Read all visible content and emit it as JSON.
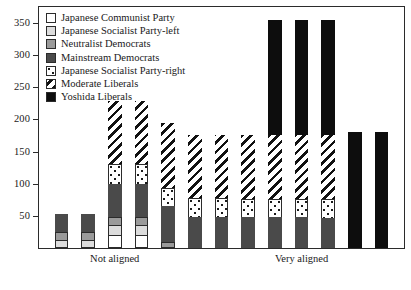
{
  "chart_data": {
    "type": "bar",
    "stacked": true,
    "title": "",
    "xlabel": "",
    "ylabel": "",
    "ylim": [
      0,
      375
    ],
    "yticks": [
      50,
      100,
      150,
      200,
      250,
      300,
      350
    ],
    "grid": false,
    "legend_position": "top-left",
    "axis_endpoint_labels": [
      "Not aligned",
      "Very aligned"
    ],
    "categories": [
      "1",
      "2",
      "3",
      "4",
      "5",
      "6",
      "7",
      "8",
      "9",
      "10",
      "11",
      "12",
      "13"
    ],
    "series": [
      {
        "name": "Japanese Communist Party",
        "fill": "white",
        "values": [
          0,
          0,
          20,
          20,
          0,
          0,
          0,
          0,
          0,
          0,
          0,
          0,
          0
        ]
      },
      {
        "name": "Japanese Socialist Party-left",
        "fill": "ltgray",
        "values": [
          12,
          12,
          18,
          18,
          0,
          0,
          0,
          0,
          0,
          0,
          0,
          0,
          0
        ]
      },
      {
        "name": "Neutralist Democrats",
        "fill": "mdgray",
        "values": [
          14,
          14,
          14,
          14,
          10,
          0,
          0,
          0,
          0,
          0,
          0,
          0,
          0
        ]
      },
      {
        "name": "Mainstream Democrats",
        "fill": "dkgray",
        "values": [
          29,
          29,
          51,
          51,
          56,
          49,
          49,
          48,
          48,
          48,
          47,
          0,
          0
        ]
      },
      {
        "name": "Japanese Socialist Party-right",
        "fill": "dots",
        "values": [
          0,
          0,
          32,
          32,
          29,
          30,
          30,
          30,
          30,
          30,
          31,
          0,
          0
        ]
      },
      {
        "name": "Moderate Liberals",
        "fill": "hatch",
        "values": [
          0,
          0,
          98,
          98,
          101,
          99,
          99,
          100,
          99,
          99,
          99,
          0,
          0
        ]
      },
      {
        "name": "Yoshida Liberals",
        "fill": "black",
        "values": [
          0,
          0,
          0,
          0,
          0,
          0,
          0,
          0,
          179,
          179,
          179,
          180,
          180
        ]
      }
    ],
    "totals": [
      55,
      55,
      233,
      233,
      196,
      178,
      178,
      178,
      356,
      356,
      356,
      180,
      180
    ]
  },
  "legend": {
    "items": [
      {
        "label": "Japanese Communist Party",
        "fill": "white"
      },
      {
        "label": "Japanese Socialist Party-left",
        "fill": "ltgray"
      },
      {
        "label": "Neutralist Democrats",
        "fill": "mdgray"
      },
      {
        "label": "Mainstream Democrats",
        "fill": "dkgray"
      },
      {
        "label": "Japanese Socialist Party-right",
        "fill": "dots"
      },
      {
        "label": "Moderate Liberals",
        "fill": "hatch"
      },
      {
        "label": "Yoshida Liberals",
        "fill": "black"
      }
    ]
  },
  "colors": {
    "white": "#ffffff",
    "ltgray": "#dcdcdc",
    "mdgray": "#9a9a9a",
    "dkgray": "#4a4a4a",
    "black": "#0d0d0d",
    "axis": "#2b2b2b",
    "text": "#1a1a1a"
  }
}
